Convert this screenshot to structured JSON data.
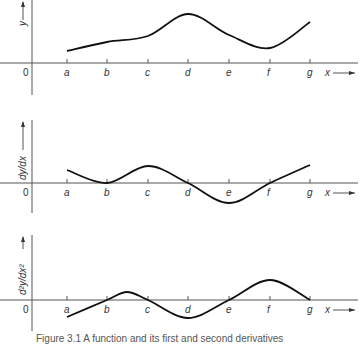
{
  "chart_data": [
    {
      "type": "line",
      "title": "",
      "xlabel": "x",
      "ylabel": "y",
      "origin_label": "0",
      "categories": [
        "a",
        "b",
        "c",
        "d",
        "e",
        "f",
        "g"
      ],
      "values": [
        12,
        21,
        27,
        49,
        28,
        15,
        41
      ],
      "grid": false
    },
    {
      "type": "line",
      "title": "",
      "xlabel": "x",
      "ylabel": "dy/dx",
      "origin_label": "0",
      "categories": [
        "a",
        "b",
        "c",
        "d",
        "e",
        "f",
        "g"
      ],
      "values": [
        13,
        0,
        17,
        0,
        -20,
        0,
        18
      ],
      "grid": false
    },
    {
      "type": "line",
      "title": "",
      "xlabel": "x",
      "ylabel": "d²y/dx²",
      "origin_label": "0",
      "categories": [
        "a",
        "b",
        "c",
        "d",
        "e",
        "f",
        "g"
      ],
      "values": [
        -17,
        0,
        0,
        -18,
        0,
        20,
        0
      ],
      "extra_points": [
        {
          "between": "b-c",
          "value": 8
        }
      ],
      "grid": false
    }
  ],
  "caption": "Figure 3.1  A function and its first and second derivatives"
}
